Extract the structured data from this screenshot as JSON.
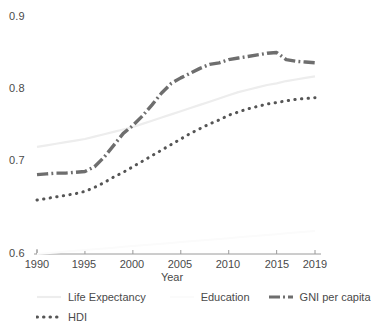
{
  "chart_data": {
    "type": "line",
    "title": "",
    "xlabel": "Year",
    "ylabel": "",
    "xlim": [
      1990,
      2019
    ],
    "ylim": [
      0.6,
      0.9
    ],
    "grid": false,
    "legend_position": "bottom",
    "x_ticks": [
      "1990",
      "1995",
      "2000",
      "2005",
      "2010",
      "2015",
      "2019"
    ],
    "x_tick_values": [
      1990,
      1995,
      2000,
      2005,
      2010,
      2015,
      2019
    ],
    "y_ticks": [
      "0.9",
      "0.8",
      "0.7",
      "0.6"
    ],
    "y_tick_values": [
      0.9,
      0.8,
      0.7,
      0.6
    ],
    "x": [
      1990,
      1991,
      1992,
      1993,
      1994,
      1995,
      1996,
      1997,
      1998,
      1999,
      2000,
      2001,
      2002,
      2003,
      2004,
      2005,
      2006,
      2007,
      2008,
      2009,
      2010,
      2011,
      2012,
      2013,
      2014,
      2015,
      2016,
      2017,
      2018,
      2019
    ],
    "series": [
      {
        "name": "Life Expectancy",
        "style": "solid",
        "color": "#ededed",
        "width": 2.2,
        "values": [
          0.735,
          0.737,
          0.739,
          0.741,
          0.743,
          0.745,
          0.748,
          0.751,
          0.754,
          0.757,
          0.76,
          0.764,
          0.768,
          0.772,
          0.776,
          0.78,
          0.784,
          0.788,
          0.792,
          0.796,
          0.8,
          0.804,
          0.807,
          0.81,
          0.813,
          0.815,
          0.818,
          0.82,
          0.822,
          0.824
        ]
      },
      {
        "name": "Education",
        "style": "solid",
        "color": "#fbfbfb",
        "width": 2.0,
        "values": [
          0.6,
          0.601,
          0.602,
          0.603,
          0.604,
          0.605,
          0.606,
          0.607,
          0.608,
          0.609,
          0.61,
          0.611,
          0.612,
          0.613,
          0.614,
          0.615,
          0.616,
          0.617,
          0.618,
          0.619,
          0.62,
          0.621,
          0.622,
          0.623,
          0.624,
          0.625,
          0.626,
          0.627,
          0.628,
          0.629
        ]
      },
      {
        "name": "GNI per capita",
        "style": "dashdot",
        "color": "#6e6e6e",
        "width": 3.4,
        "values": [
          0.7,
          0.701,
          0.702,
          0.702,
          0.703,
          0.704,
          0.71,
          0.722,
          0.737,
          0.752,
          0.762,
          0.774,
          0.788,
          0.803,
          0.815,
          0.822,
          0.828,
          0.834,
          0.839,
          0.841,
          0.845,
          0.847,
          0.849,
          0.851,
          0.853,
          0.854,
          0.845,
          0.843,
          0.842,
          0.841
        ]
      },
      {
        "name": "HDI",
        "style": "dotted",
        "color": "#555555",
        "width": 3.0,
        "values": [
          0.668,
          0.67,
          0.672,
          0.674,
          0.676,
          0.679,
          0.684,
          0.69,
          0.697,
          0.703,
          0.71,
          0.717,
          0.724,
          0.731,
          0.738,
          0.745,
          0.752,
          0.758,
          0.764,
          0.769,
          0.775,
          0.779,
          0.783,
          0.786,
          0.789,
          0.791,
          0.793,
          0.795,
          0.796,
          0.797
        ]
      }
    ]
  },
  "legend": {
    "row1": [
      {
        "label": "Life Expectancy"
      },
      {
        "label": "Education"
      },
      {
        "label": "GNI per capita"
      }
    ],
    "row2": [
      {
        "label": "HDI"
      }
    ]
  },
  "axis": {
    "x_title": "Year"
  }
}
